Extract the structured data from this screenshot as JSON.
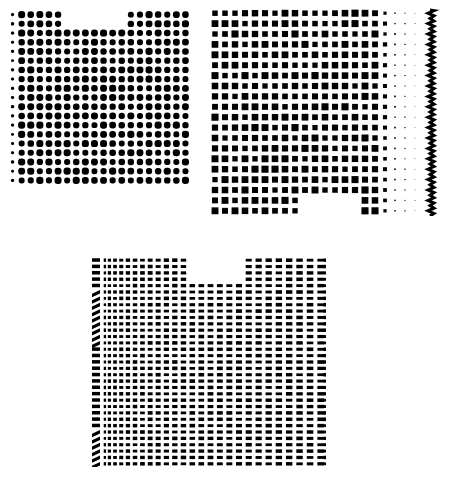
{
  "figure": {
    "background": "#ffffff",
    "ink": "#000000",
    "panels": [
      {
        "id": "top-left",
        "description": "Regular dot grid with notch at top",
        "x": 8,
        "y": 10,
        "width": 182,
        "height": 175,
        "cols": 20,
        "rows": 19,
        "dot_shape": "round",
        "notch": {
          "x": 58,
          "width": 60,
          "depth": 22
        }
      },
      {
        "id": "top-right",
        "description": "Square dot grid, fading on right with zigzag edge, notch at bottom",
        "x": 210,
        "y": 8,
        "width": 232,
        "height": 208,
        "cols": 21,
        "rows": 20,
        "dot_shape": "square",
        "notch": {
          "x": 90,
          "width": 60,
          "depth": 22,
          "edge": "bottom"
        },
        "fade_cols": 3,
        "zigzag_edge": true
      },
      {
        "id": "bottom",
        "description": "Horizontally compressed dash grid with stretched left columns, notch at top",
        "x": 92,
        "y": 257,
        "width": 234,
        "height": 210,
        "cols": 27,
        "rows": 33,
        "dot_shape": "dash",
        "notch": {
          "x": 92,
          "width": 62,
          "depth": 24
        },
        "left_stripe": true
      }
    ]
  }
}
